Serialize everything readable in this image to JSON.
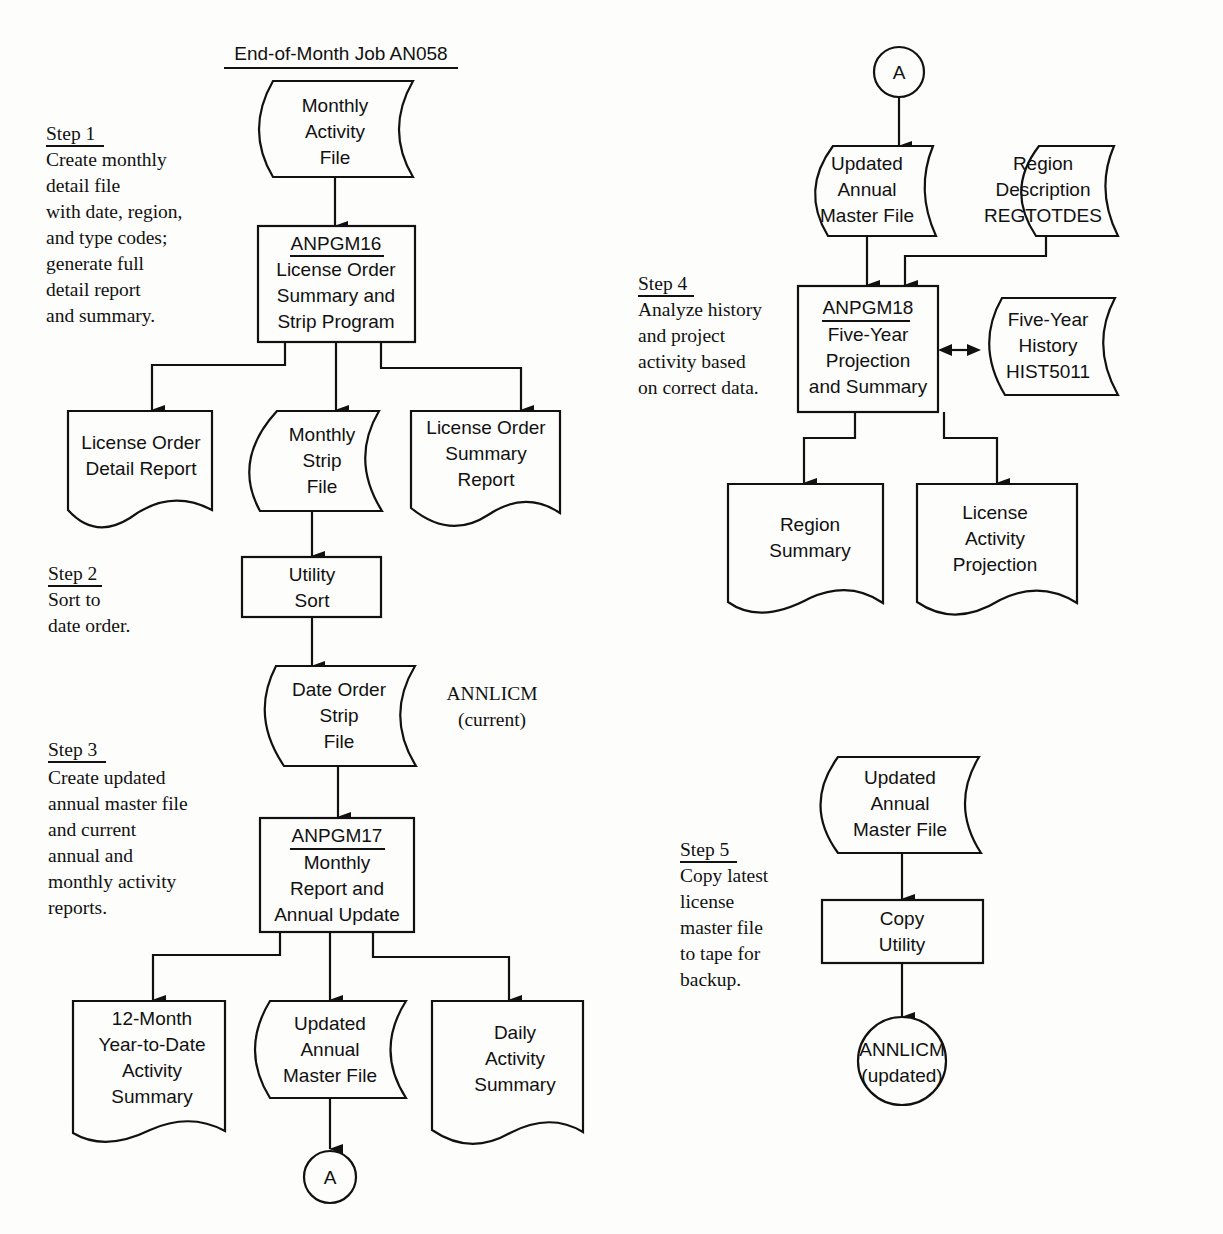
{
  "title": "End-of-Month Job AN058",
  "steps": [
    {
      "heading": "Step 1",
      "lines": [
        "Create monthly",
        "detail file",
        "with date, region,",
        "and type codes;",
        "generate full",
        "detail report",
        "and summary."
      ]
    },
    {
      "heading": "Step 2",
      "lines": [
        "Sort to",
        "date order."
      ]
    },
    {
      "heading": "Step 3",
      "lines": [
        "Create updated",
        "annual master file",
        "and current",
        "annual and",
        "monthly activity",
        "reports."
      ]
    },
    {
      "heading": "Step 4",
      "lines": [
        "Analyze history",
        "and project",
        "activity based",
        "on correct data."
      ]
    },
    {
      "heading": "Step 5",
      "lines": [
        "Copy latest",
        "license",
        "master file",
        "to tape for",
        "backup."
      ]
    }
  ],
  "nodes": {
    "monthly_activity_file": {
      "type": "file",
      "lines": [
        "Monthly",
        "Activity",
        "File"
      ]
    },
    "anpgm16": {
      "type": "process",
      "program": "ANPGM16",
      "lines": [
        "License Order",
        "Summary and",
        "Strip Program"
      ]
    },
    "license_order_detail_report": {
      "type": "document",
      "lines": [
        "License Order",
        "Detail Report"
      ]
    },
    "monthly_strip_file": {
      "type": "file",
      "lines": [
        "Monthly",
        "Strip",
        "File"
      ]
    },
    "license_order_summary_report": {
      "type": "document",
      "lines": [
        "License Order",
        "Summary",
        "Report"
      ]
    },
    "utility_sort": {
      "type": "process",
      "lines": [
        "Utility",
        "Sort"
      ]
    },
    "date_order_strip_file": {
      "type": "file",
      "lines": [
        "Date Order",
        "Strip",
        "File"
      ]
    },
    "annlicm_current": {
      "type": "annotation",
      "lines": [
        "ANNLICM",
        "(current)"
      ]
    },
    "anpgm17": {
      "type": "process",
      "program": "ANPGM17",
      "lines": [
        "Monthly",
        "Report and",
        "Annual Update"
      ]
    },
    "ytd_activity_summary": {
      "type": "document",
      "lines": [
        "12-Month",
        "Year-to-Date",
        "Activity",
        "Summary"
      ]
    },
    "updated_master_1": {
      "type": "file",
      "lines": [
        "Updated",
        "Annual",
        "Master File"
      ]
    },
    "daily_activity_summary": {
      "type": "document",
      "lines": [
        "Daily",
        "Activity",
        "Summary"
      ]
    },
    "connector_a_out": {
      "type": "connector",
      "label": "A"
    },
    "connector_a_in": {
      "type": "connector",
      "label": "A"
    },
    "updated_master_2": {
      "type": "file",
      "lines": [
        "Updated",
        "Annual",
        "Master File"
      ]
    },
    "region_description": {
      "type": "file",
      "lines": [
        "Region",
        "Description",
        "REGTOTDES"
      ]
    },
    "anpgm18": {
      "type": "process",
      "program": "ANPGM18",
      "lines": [
        "Five-Year",
        "Projection",
        "and Summary"
      ]
    },
    "five_year_history": {
      "type": "file",
      "lines": [
        "Five-Year",
        "History",
        "HIST5011"
      ]
    },
    "region_summary": {
      "type": "document",
      "lines": [
        "Region",
        "Summary"
      ]
    },
    "license_activity_projection": {
      "type": "document",
      "lines": [
        "License",
        "Activity",
        "Projection"
      ]
    },
    "updated_master_3": {
      "type": "file",
      "lines": [
        "Updated",
        "Annual",
        "Master File"
      ]
    },
    "copy_utility": {
      "type": "process",
      "lines": [
        "Copy",
        "Utility"
      ]
    },
    "annlicm_updated": {
      "type": "terminal",
      "lines": [
        "ANNLICM",
        "(updated)"
      ]
    }
  }
}
